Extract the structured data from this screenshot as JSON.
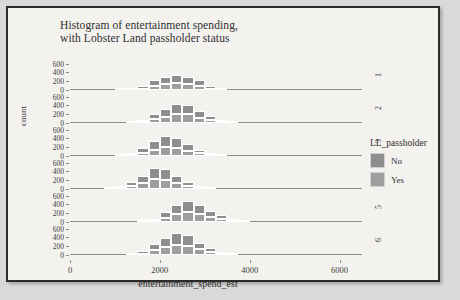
{
  "chart_data": {
    "type": "bar",
    "title": "Histogram of entertainment spending,",
    "title_line2": "with Lobster Land passholder status",
    "xlabel": "entertainment_spend_est",
    "ylabel": "count",
    "xlim": [
      0,
      6500
    ],
    "ylim": [
      0,
      700
    ],
    "xticks": [
      0,
      2000,
      4000,
      6000
    ],
    "xtick_labels": [
      "0",
      "2000",
      "4000",
      "6000"
    ],
    "yticks": [
      0,
      200,
      400,
      600
    ],
    "ytick_labels": [
      "0",
      "200",
      "400",
      "600"
    ],
    "grid": false,
    "stacked": true,
    "legend": {
      "title": "LL_passholder",
      "position": "right",
      "entries": [
        {
          "label": "No",
          "color": "#8e8e8e"
        },
        {
          "label": "Yes",
          "color": "#9e9e9e"
        }
      ]
    },
    "facet_variable": "group",
    "facets": [
      {
        "strip_label": "1",
        "bin_width": 250,
        "bins": [
          1125,
          1375,
          1625,
          1875,
          2125,
          2375,
          2625,
          2875,
          3125,
          3375
        ],
        "series": [
          {
            "name": "No",
            "values": [
              5,
              20,
              60,
              130,
              175,
              195,
              165,
              130,
              55,
              10
            ]
          },
          {
            "name": "Yes",
            "values": [
              2,
              10,
              35,
              95,
              140,
              165,
              135,
              95,
              35,
              5
            ]
          }
        ]
      },
      {
        "strip_label": "2",
        "bin_width": 250,
        "bins": [
          1375,
          1625,
          1875,
          2125,
          2375,
          2625,
          2875,
          3125,
          3375,
          3625
        ],
        "series": [
          {
            "name": "No",
            "values": [
              10,
              45,
              125,
              180,
              230,
              225,
              150,
              90,
              40,
              8
            ]
          },
          {
            "name": "Yes",
            "values": [
              5,
              30,
              95,
              150,
              205,
              200,
              120,
              70,
              25,
              4
            ]
          }
        ]
      },
      {
        "strip_label": "3",
        "bin_width": 250,
        "bins": [
          1125,
          1375,
          1625,
          1875,
          2125,
          2375,
          2625,
          2875,
          3125,
          3375
        ],
        "series": [
          {
            "name": "No",
            "values": [
              8,
              40,
              100,
              190,
              255,
              230,
              150,
              85,
              35,
              7
            ]
          },
          {
            "name": "Yes",
            "values": [
              4,
              25,
              80,
              150,
              215,
              195,
              120,
              65,
              22,
              3
            ]
          }
        ]
      },
      {
        "strip_label": "4",
        "bin_width": 250,
        "bins": [
          875,
          1125,
          1375,
          1625,
          1875,
          2125,
          2375,
          2625,
          2875,
          3125
        ],
        "series": [
          {
            "name": "No",
            "values": [
              6,
              35,
              90,
              175,
              265,
              255,
              165,
              95,
              30,
              5
            ]
          },
          {
            "name": "Yes",
            "values": [
              3,
              22,
              70,
              140,
              230,
              220,
              130,
              70,
              20,
              3
            ]
          }
        ]
      },
      {
        "strip_label": "5",
        "bin_width": 250,
        "bins": [
          1625,
          1875,
          2125,
          2375,
          2625,
          2875,
          3125,
          3375,
          3625,
          3875
        ],
        "series": [
          {
            "name": "No",
            "values": [
              10,
              50,
              130,
              215,
              260,
              210,
              145,
              95,
              45,
              10
            ]
          },
          {
            "name": "Yes",
            "values": [
              5,
              32,
              100,
              180,
              225,
              180,
              115,
              70,
              30,
              6
            ]
          }
        ]
      },
      {
        "strip_label": "6",
        "bin_width": 250,
        "bins": [
          1375,
          1625,
          1875,
          2125,
          2375,
          2625,
          2875,
          3125,
          3375,
          3625
        ],
        "series": [
          {
            "name": "No",
            "values": [
              12,
              55,
              140,
              215,
              280,
              250,
              160,
              95,
              40,
              9
            ]
          },
          {
            "name": "Yes",
            "values": [
              6,
              35,
              110,
              180,
              245,
              215,
              130,
              70,
              25,
              5
            ]
          }
        ]
      }
    ]
  }
}
